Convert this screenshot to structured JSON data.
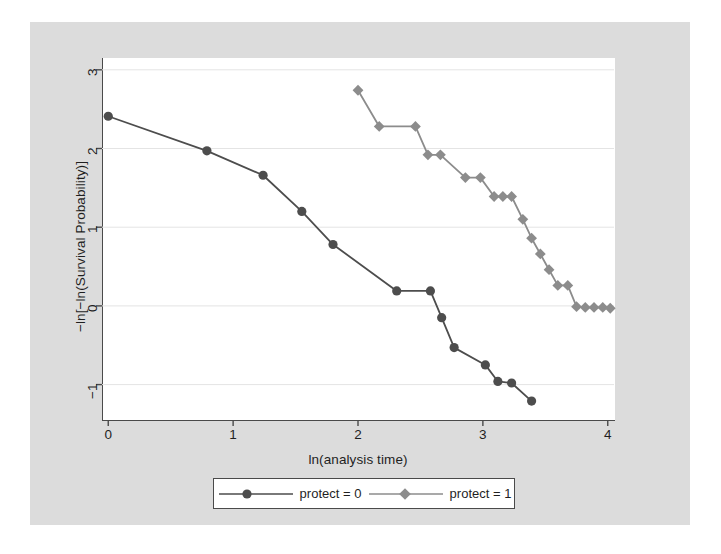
{
  "chart_data": {
    "type": "line",
    "title": "",
    "subtitle": "",
    "xlabel": "ln(analysis time)",
    "ylabel": "−ln[−ln(Survival Probability)]",
    "xlim": [
      -0.05,
      4.05
    ],
    "ylim": [
      -1.45,
      3.15
    ],
    "xticks": [
      0,
      1,
      2,
      3,
      4
    ],
    "xticklabels": [
      "0",
      "1",
      "2",
      "3",
      "4"
    ],
    "yticks": [
      -1,
      0,
      1,
      2,
      3
    ],
    "yticklabels": [
      "−1",
      "0",
      "1",
      "2",
      "3"
    ],
    "grid": "horizontal",
    "grid_color": "#e4e4e4",
    "legend_position": "below-center",
    "legend_entries": [
      "protect = 0",
      "protect = 1"
    ],
    "series": [
      {
        "name": "protect = 0",
        "label": "protect = 0",
        "color": "#4d4d4d",
        "marker": "circle",
        "x": [
          0.0,
          0.79,
          1.24,
          1.55,
          1.8,
          2.31,
          2.58,
          2.67,
          2.77,
          3.02,
          3.12,
          3.23,
          3.39
        ],
        "y": [
          2.41,
          1.97,
          1.66,
          1.2,
          0.78,
          0.19,
          0.19,
          -0.15,
          -0.53,
          -0.75,
          -0.96,
          -0.98,
          -1.21
        ]
      },
      {
        "name": "protect = 1",
        "label": "protect = 1",
        "color": "#8c8c8c",
        "marker": "diamond",
        "x": [
          2.0,
          2.17,
          2.46,
          2.56,
          2.66,
          2.86,
          2.98,
          3.09,
          3.16,
          3.23,
          3.32,
          3.39,
          3.46,
          3.53,
          3.6,
          3.68,
          3.75,
          3.82,
          3.89,
          3.96,
          4.02
        ],
        "y": [
          2.74,
          2.28,
          2.28,
          1.92,
          1.92,
          1.63,
          1.63,
          1.39,
          1.39,
          1.39,
          1.1,
          0.86,
          0.66,
          0.46,
          0.26,
          0.26,
          -0.01,
          -0.02,
          -0.02,
          -0.02,
          -0.03
        ]
      }
    ]
  },
  "axes": {
    "x_label": "ln(analysis time)",
    "y_label": "−ln[−ln(Survival Probability)]"
  },
  "legend": {
    "entries": [
      {
        "label": "protect = 0",
        "color": "#4d4d4d",
        "marker": "circle"
      },
      {
        "label": "protect = 1",
        "color": "#8c8c8c",
        "marker": "diamond"
      }
    ]
  },
  "colors": {
    "figure_background": "#dcdcdc",
    "plot_background": "#ffffff",
    "axis": "#4a4a4a",
    "grid": "#e4e4e4",
    "series_0": "#4d4d4d",
    "series_1": "#8c8c8c",
    "text": "#1f1f1f"
  }
}
